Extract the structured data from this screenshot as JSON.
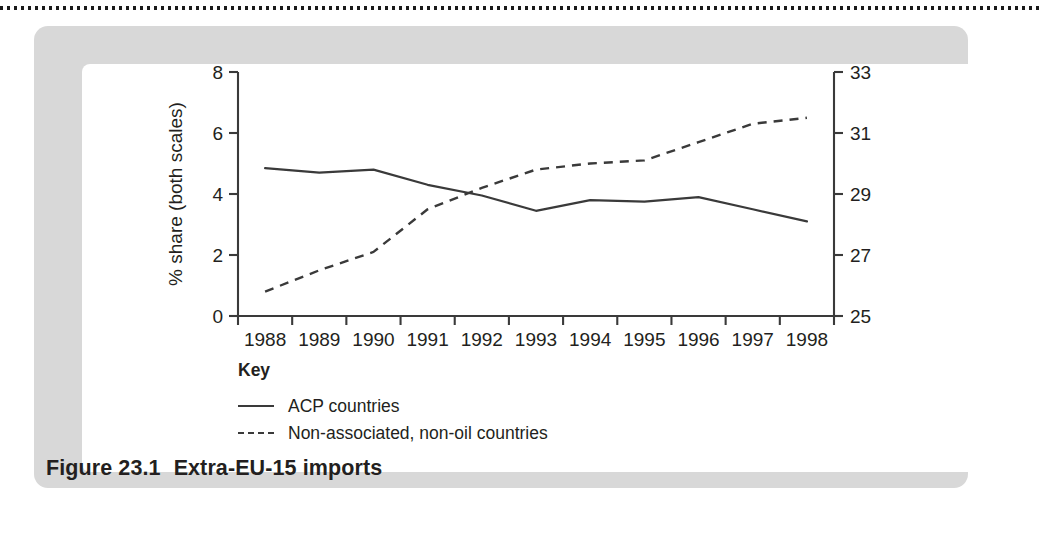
{
  "figure": {
    "caption_number": "Figure 23.1",
    "caption_text": "Extra-EU-15 imports"
  },
  "legend": {
    "title": "Key",
    "entries": [
      {
        "label": "ACP countries",
        "style": "solid"
      },
      {
        "label": "Non-associated, non-oil countries",
        "style": "dashed"
      }
    ]
  },
  "chart_data": {
    "type": "line",
    "title": "Extra-EU-15 imports",
    "xlabel": "",
    "ylabel": "% share (both scales)",
    "grid": false,
    "legend_position": "below-left",
    "x": [
      "1988",
      "1989",
      "1990",
      "1991",
      "1992",
      "1993",
      "1994",
      "1995",
      "1996",
      "1997",
      "1998"
    ],
    "xtick_labels": [
      "1988",
      "1989",
      "1990",
      "1991",
      "1992",
      "1993",
      "1994",
      "1995",
      "1996",
      "1997",
      "1998"
    ],
    "left_axis": {
      "label": "% share (both scales)",
      "ylim": [
        0,
        8
      ],
      "ticks": [
        0,
        2,
        4,
        6,
        8
      ],
      "tick_labels": [
        "0",
        "2",
        "4",
        "6",
        "8"
      ]
    },
    "right_axis": {
      "label": "",
      "ylim": [
        25,
        33
      ],
      "ticks": [
        25,
        27,
        29,
        31,
        33
      ],
      "tick_labels": [
        "25",
        "27",
        "29",
        "31",
        "33"
      ]
    },
    "series": [
      {
        "name": "ACP countries",
        "axis": "left",
        "style": "solid",
        "color": "#3a3a3a",
        "values": [
          4.85,
          4.7,
          4.8,
          4.3,
          3.95,
          3.45,
          3.8,
          3.75,
          3.9,
          3.5,
          3.1
        ]
      },
      {
        "name": "Non-associated, non-oil countries",
        "axis": "right",
        "style": "dashed",
        "color": "#3a3a3a",
        "values": [
          25.8,
          26.5,
          27.1,
          28.5,
          29.2,
          29.8,
          30.0,
          30.1,
          30.7,
          31.3,
          31.5
        ]
      }
    ]
  },
  "colors": {
    "panel": "#d8d8d8",
    "plate": "#ffffff",
    "ink": "#231f20",
    "line": "#3a3a3a"
  }
}
